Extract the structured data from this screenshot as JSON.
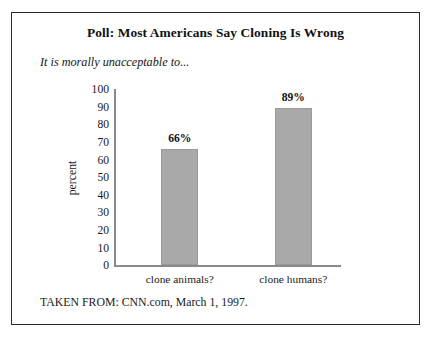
{
  "figure": {
    "title": "Poll: Most Americans Say Cloning Is Wrong",
    "subtitle": "It is morally unacceptable to...",
    "source_note": "TAKEN FROM: CNN.com, March 1, 1997.",
    "frame_color": "#2a2a2a",
    "background_color": "#ffffff"
  },
  "chart_data": {
    "type": "bar",
    "title": "Poll: Most Americans Say Cloning Is Wrong",
    "subtitle": "It is morally unacceptable to...",
    "categories": [
      "clone animals?",
      "clone humans?"
    ],
    "values": [
      66,
      89
    ],
    "value_labels": [
      "66%",
      "89%"
    ],
    "xlabel": "",
    "ylabel": "percent",
    "ylim": [
      0,
      100
    ],
    "ytick_step": 10,
    "yticks": [
      100,
      90,
      80,
      70,
      60,
      50,
      40,
      30,
      20,
      10,
      0
    ],
    "ytick_labels": [
      "100",
      "90",
      "80",
      "70",
      "60",
      "50",
      "40",
      "30",
      "20",
      "10",
      "0"
    ],
    "grid": false,
    "legend": false,
    "bar_color": "#a9a9a9",
    "bar_edge_color": "#9a9a9a",
    "axis_color": "#8a8a8a",
    "source": "TAKEN FROM: CNN.com, March 1, 1997."
  }
}
